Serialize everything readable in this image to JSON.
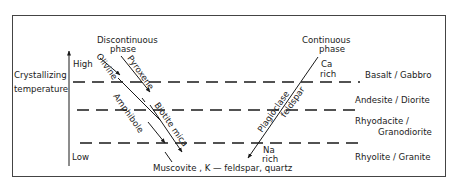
{
  "diagram": {
    "axis": {
      "label_line1": "Crystallizing",
      "label_line2": "temperature",
      "high": "High",
      "low": "Low"
    },
    "discontinuous": {
      "header_line1": "Discontinuous",
      "header_line2": "phase",
      "minerals": [
        "Olivine",
        "Pyroxene",
        "Amphibole",
        "Biotite mica"
      ]
    },
    "continuous": {
      "header_line1": "Continuous",
      "header_line2": "phase",
      "top_line1": "Ca",
      "top_line2": "rich",
      "mineral_line1": "Plagioclase",
      "mineral_line2": "feldspar",
      "bottom_line1": "Na",
      "bottom_line2": "rich"
    },
    "bottom_label": "Muscovite , K — feldspar, quartz",
    "rock_types": [
      {
        "line1": "Basalt / Gabbro"
      },
      {
        "line1": "Andesite / Diorite"
      },
      {
        "line1": "Rhyodacite /",
        "line2": "Granodiorite"
      },
      {
        "line1": "Rhyolite / Granite"
      }
    ],
    "colors": {
      "ink": "#1a1a1a",
      "border": "#444444",
      "background": "#ffffff"
    }
  }
}
